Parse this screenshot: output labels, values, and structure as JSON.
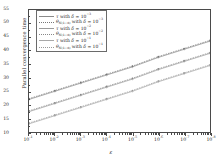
{
  "chart_data": {
    "type": "line",
    "title": "",
    "xlabel": "ε",
    "ylabel": "Parallel convergence time",
    "xscale": "log",
    "yscale": "linear",
    "xlim": [
      0.1,
      1e-08
    ],
    "ylim": [
      10,
      55
    ],
    "grid": false,
    "legend_position": "top-left",
    "x_tick_labels": [
      "10⁻¹",
      "10⁻²",
      "10⁻³",
      "10⁻⁴",
      "10⁻⁵",
      "10⁻⁶",
      "10⁻⁷",
      "10⁻⁸"
    ],
    "x_tick_exponents": [
      "-1",
      "-2",
      "-3",
      "-4",
      "-5",
      "-6",
      "-7",
      "-8"
    ],
    "y_tick_labels": [
      "10",
      "15",
      "20",
      "25",
      "30",
      "35",
      "40",
      "45",
      "50",
      "55"
    ],
    "y_tick_values": [
      10,
      15,
      20,
      25,
      30,
      35,
      40,
      45,
      50,
      55
    ],
    "x": [
      0.1,
      0.01,
      0.001,
      0.0001,
      1e-05,
      1e-06,
      1e-07,
      1e-08
    ],
    "series": [
      {
        "name": "tau-delta-1e-3",
        "legend_label": "τ with δ = 10⁻³",
        "style": "solid",
        "color": "#8a8a8a",
        "values": [
          22.0,
          25.0,
          28.0,
          31.0,
          34.0,
          37.5,
          40.5,
          43.5
        ]
      },
      {
        "name": "theta-N1d-delta-1e-3",
        "legend_label": "θ_N(1−d) with δ = 10⁻³",
        "style": "dotted",
        "color": "#777777",
        "values": [
          22.3,
          25.3,
          28.3,
          31.3,
          34.3,
          37.8,
          40.8,
          43.8
        ]
      },
      {
        "name": "tau-delta-1e-2",
        "legend_label": "τ with δ = 10⁻²",
        "style": "solid",
        "color": "#9a9a9a",
        "values": [
          17.5,
          20.5,
          23.5,
          26.5,
          29.5,
          33.0,
          36.0,
          39.0
        ]
      },
      {
        "name": "theta-N1d-delta-1e-2",
        "legend_label": "θ_N(1−d) with δ = 10⁻²",
        "style": "dotted",
        "color": "#888888",
        "values": [
          17.8,
          20.8,
          23.8,
          26.8,
          29.8,
          33.3,
          36.3,
          39.3
        ]
      },
      {
        "name": "tau-delta-1e-1",
        "legend_label": "τ with δ = 10⁻¹",
        "style": "solid",
        "color": "#a8a8a8",
        "values": [
          13.0,
          16.0,
          19.0,
          22.0,
          25.0,
          28.5,
          31.5,
          34.5
        ]
      },
      {
        "name": "theta-N1d-delta-1e-1",
        "legend_label": "θ_N(1−d) with δ = 10⁻¹",
        "style": "dotted",
        "color": "#999999",
        "values": [
          13.3,
          16.3,
          19.3,
          22.3,
          25.3,
          28.8,
          31.8,
          34.8
        ]
      }
    ]
  },
  "legend": {
    "entries": [
      {
        "symbol": "tau",
        "prefix": "τ",
        "middle": " with ",
        "delta": "δ",
        "equals": " = 10",
        "exponent": "−3",
        "style": "solid"
      },
      {
        "symbol": "theta",
        "prefix": "θ",
        "subscript": "N(1−d)",
        "middle": " with ",
        "delta": "δ",
        "equals": " = 10",
        "exponent": "−3",
        "style": "dotted"
      },
      {
        "symbol": "tau",
        "prefix": "τ",
        "middle": " with ",
        "delta": "δ",
        "equals": " = 10",
        "exponent": "−2",
        "style": "solid"
      },
      {
        "symbol": "theta",
        "prefix": "θ",
        "subscript": "N(1−d)",
        "middle": " with ",
        "delta": "δ",
        "equals": " = 10",
        "exponent": "−2",
        "style": "dotted"
      },
      {
        "symbol": "tau",
        "prefix": "τ",
        "middle": " with ",
        "delta": "δ",
        "equals": " = 10",
        "exponent": "−1",
        "style": "solid"
      },
      {
        "symbol": "theta",
        "prefix": "θ",
        "subscript": "N(1−d)",
        "middle": " with ",
        "delta": "δ",
        "equals": " = 10",
        "exponent": "−1",
        "style": "dotted"
      }
    ]
  },
  "axes": {
    "y_label_text": "Parallel convergence time",
    "x_label_text": "ε"
  }
}
